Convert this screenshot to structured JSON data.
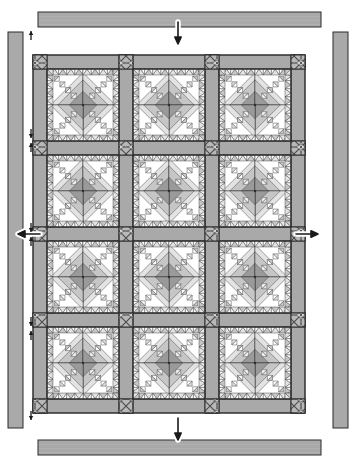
{
  "diagram": {
    "type": "quilt-assembly-diagram",
    "canvas": {
      "width": 358,
      "height": 467
    },
    "background_color": "#ffffff"
  },
  "palette": {
    "outline": "#2b2b2b",
    "sashing_gray": "#a9a9a9",
    "border_gray": "#a9a9a9",
    "block_background": "#ffffff",
    "light_gray": "#e3e3e3",
    "mid_gray": "#c6c6c6",
    "dark_gray": "#9a9a9a",
    "post_gray": "#b4b4b4",
    "arrow_fill": "#1a1a1a",
    "arrow_outline": "#ffffff"
  },
  "layout": {
    "center_x": 33,
    "center_y": 55,
    "center_width": 280,
    "center_height": 375,
    "block_size": 72,
    "sashing_width": 14,
    "post_size": 14,
    "rows": 4,
    "cols": 3
  },
  "quilt_center": {
    "name": "quilt-center",
    "rows": 4,
    "cols": 3,
    "block_count": 12,
    "block_name": "feathered-star-pinwheel-block"
  },
  "sashing": {
    "name": "sashing",
    "color": "#a9a9a9",
    "strip_count_horizontal": 5,
    "strip_count_vertical": 4,
    "post_count": 20,
    "post_name": "sashing-post-star"
  },
  "borders": [
    {
      "id": "top-border",
      "label": "top-border-strip",
      "x": 38,
      "y": 12,
      "width": 283,
      "height": 15,
      "orientation": "horizontal"
    },
    {
      "id": "bottom-border",
      "label": "bottom-border-strip",
      "x": 38,
      "y": 440,
      "width": 283,
      "height": 15,
      "orientation": "horizontal"
    },
    {
      "id": "left-border",
      "label": "left-border-strip",
      "x": 8,
      "y": 32,
      "width": 15,
      "height": 396,
      "orientation": "vertical"
    },
    {
      "id": "right-border",
      "label": "right-border-strip",
      "x": 333,
      "y": 32,
      "width": 15,
      "height": 396,
      "orientation": "vertical"
    }
  ],
  "arrows": [
    {
      "id": "arrow-top",
      "direction": "down",
      "x": 178,
      "y": 22,
      "length": 22
    },
    {
      "id": "arrow-bottom",
      "direction": "down",
      "x": 178,
      "y": 418,
      "length": 22
    },
    {
      "id": "arrow-left",
      "direction": "left",
      "x": 18,
      "y": 234,
      "length": 22
    },
    {
      "id": "arrow-right",
      "direction": "right",
      "x": 318,
      "y": 234,
      "length": 22
    }
  ],
  "tick_marks": [
    {
      "id": "tick-left-1",
      "x": 31,
      "y": 40,
      "direction": "up"
    },
    {
      "id": "tick-left-2",
      "x": 31,
      "y": 138,
      "direction": "down"
    },
    {
      "id": "tick-left-3",
      "x": 31,
      "y": 152,
      "direction": "up"
    },
    {
      "id": "tick-left-4",
      "x": 31,
      "y": 232,
      "direction": "down"
    },
    {
      "id": "tick-left-5",
      "x": 31,
      "y": 246,
      "direction": "up"
    },
    {
      "id": "tick-left-6",
      "x": 31,
      "y": 326,
      "direction": "down"
    },
    {
      "id": "tick-left-7",
      "x": 31,
      "y": 340,
      "direction": "up"
    },
    {
      "id": "tick-left-8",
      "x": 31,
      "y": 420,
      "direction": "down"
    }
  ]
}
